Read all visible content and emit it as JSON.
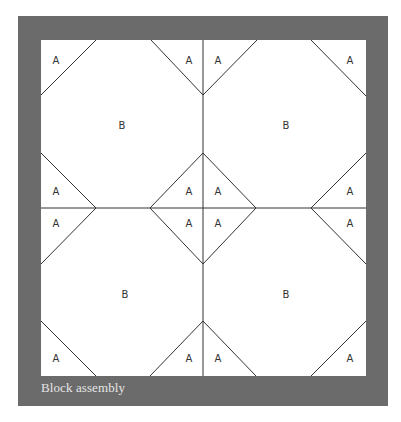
{
  "figure": {
    "caption": "Block assembly",
    "colors": {
      "frame": "#6b6b6b",
      "inner": "#ffffff",
      "line": "#333333"
    },
    "frame": {
      "x": 18,
      "y": 16,
      "width": 370,
      "height": 390
    },
    "inner": {
      "x": 41,
      "y": 40,
      "width": 325,
      "height": 336
    },
    "center": {
      "x": 203,
      "y": 208
    }
  },
  "pieces": {
    "labels": [
      {
        "text": "A",
        "x": 56,
        "y": 64
      },
      {
        "text": "A",
        "x": 189,
        "y": 64
      },
      {
        "text": "A",
        "x": 218,
        "y": 64
      },
      {
        "text": "A",
        "x": 350,
        "y": 64
      },
      {
        "text": "B",
        "x": 122,
        "y": 129
      },
      {
        "text": "B",
        "x": 286,
        "y": 129
      },
      {
        "text": "A",
        "x": 56,
        "y": 195
      },
      {
        "text": "A",
        "x": 189,
        "y": 195
      },
      {
        "text": "A",
        "x": 218,
        "y": 195
      },
      {
        "text": "A",
        "x": 350,
        "y": 195
      },
      {
        "text": "A",
        "x": 56,
        "y": 227
      },
      {
        "text": "A",
        "x": 189,
        "y": 227
      },
      {
        "text": "A",
        "x": 218,
        "y": 227
      },
      {
        "text": "A",
        "x": 350,
        "y": 227
      },
      {
        "text": "B",
        "x": 125,
        "y": 298
      },
      {
        "text": "B",
        "x": 286,
        "y": 298
      },
      {
        "text": "A",
        "x": 56,
        "y": 362
      },
      {
        "text": "A",
        "x": 189,
        "y": 362
      },
      {
        "text": "A",
        "x": 218,
        "y": 362
      },
      {
        "text": "A",
        "x": 350,
        "y": 362
      }
    ],
    "lines": [
      [
        41,
        95,
        96,
        40
      ],
      [
        151,
        40,
        203,
        95
      ],
      [
        203,
        95,
        257,
        40
      ],
      [
        311,
        40,
        366,
        96
      ],
      [
        41,
        153,
        96,
        208
      ],
      [
        96,
        208,
        41,
        264
      ],
      [
        366,
        153,
        311,
        208
      ],
      [
        311,
        208,
        366,
        264
      ],
      [
        203,
        153,
        150,
        208
      ],
      [
        150,
        208,
        203,
        264
      ],
      [
        203,
        153,
        256,
        208
      ],
      [
        256,
        208,
        203,
        264
      ],
      [
        41,
        321,
        96,
        376
      ],
      [
        150,
        376,
        203,
        321
      ],
      [
        203,
        321,
        256,
        376
      ],
      [
        311,
        376,
        366,
        321
      ],
      [
        203,
        40,
        203,
        376
      ],
      [
        41,
        208,
        366,
        208
      ]
    ]
  }
}
